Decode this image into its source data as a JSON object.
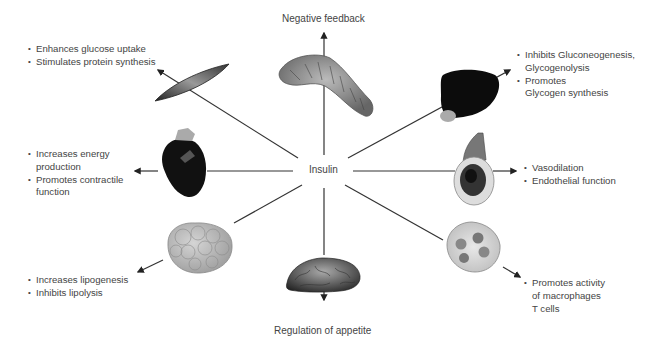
{
  "center": {
    "label": "Insulin"
  },
  "targets": {
    "pancreas": {
      "organ": "pancreas",
      "effects_title": "Negative feedback"
    },
    "muscle": {
      "organ": "skeletal-muscle",
      "effects": [
        "Enhances glucose uptake",
        "Stimulates protein synthesis"
      ]
    },
    "liver": {
      "organ": "liver",
      "effects": [
        "Inhibits Gluconeogenesis,",
        "Glycogenolysis",
        "Promotes",
        "Glycogen synthesis"
      ]
    },
    "heart": {
      "organ": "heart",
      "effects": [
        "Increases energy",
        "production",
        "Promotes contractile",
        "function"
      ]
    },
    "vessel": {
      "organ": "blood-vessel",
      "effects": [
        "Vasodilation",
        "Endothelial function"
      ]
    },
    "adipose": {
      "organ": "adipose-tissue",
      "effects": [
        "Increases lipogenesis",
        "Inhibits lipolysis"
      ]
    },
    "brain": {
      "organ": "brain",
      "effects_title": "Regulation of appetite"
    },
    "immune": {
      "organ": "immune-cell",
      "effects": [
        "Promotes activity",
        "of macrophages",
        "T cells"
      ]
    }
  },
  "colors": {
    "line": "#333333",
    "text": "#444444",
    "organ_dark": "#111111",
    "organ_gray": "#9a9a9a"
  }
}
